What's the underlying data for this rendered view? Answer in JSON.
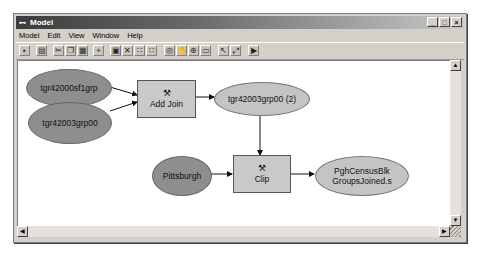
{
  "window": {
    "title": "Model",
    "app_icon": "model-builder-icon",
    "controls": {
      "minimize": "_",
      "maximize": "□",
      "close": "×"
    }
  },
  "menubar": {
    "items": [
      "Model",
      "Edit",
      "View",
      "Window",
      "Help"
    ]
  },
  "toolbar": {
    "buttons": [
      {
        "name": "save-icon",
        "glyph": "▪"
      },
      {
        "name": "print-icon",
        "glyph": "▤"
      },
      {
        "name": "cut-icon",
        "glyph": "✂"
      },
      {
        "name": "copy-icon",
        "glyph": "❐"
      },
      {
        "name": "paste-icon",
        "glyph": "▦"
      },
      {
        "name": "add-data-icon",
        "glyph": "+"
      },
      {
        "name": "properties-icon",
        "glyph": "▣"
      },
      {
        "name": "delete-icon",
        "glyph": "✕"
      },
      {
        "name": "layout-grid-icon",
        "glyph": "∷"
      },
      {
        "name": "layout-auto-icon",
        "glyph": "∷"
      },
      {
        "name": "zoom-full-icon",
        "glyph": "◎"
      },
      {
        "name": "pan-icon",
        "glyph": "✋"
      },
      {
        "name": "zoom-in-icon",
        "glyph": "⊕"
      },
      {
        "name": "zoom-extent-icon",
        "glyph": "▭"
      },
      {
        "name": "select-icon",
        "glyph": "↖"
      },
      {
        "name": "connect-icon",
        "glyph": "⤢"
      },
      {
        "name": "run-icon",
        "glyph": "▶"
      }
    ]
  },
  "diagram": {
    "nodes": [
      {
        "id": "n1",
        "label": "tgr42000sf1grp",
        "type": "input-data"
      },
      {
        "id": "n2",
        "label": "tgr42003grp00",
        "type": "input-data"
      },
      {
        "id": "n3",
        "label": "Add Join",
        "type": "tool"
      },
      {
        "id": "n4",
        "label": "tgr42003grp00 (2)",
        "type": "derived-data"
      },
      {
        "id": "n5",
        "label": "Pittsburgh",
        "type": "input-data"
      },
      {
        "id": "n6",
        "label": "Clip",
        "type": "tool"
      },
      {
        "id": "n7",
        "label": "PghCensusBlk GroupsJoined.s",
        "label_line1": "PghCensusBlk",
        "label_line2": "GroupsJoined.s",
        "type": "derived-data"
      }
    ],
    "edges": [
      [
        "n1",
        "n3"
      ],
      [
        "n2",
        "n3"
      ],
      [
        "n3",
        "n4"
      ],
      [
        "n4",
        "n6"
      ],
      [
        "n5",
        "n6"
      ],
      [
        "n6",
        "n7"
      ]
    ],
    "colors": {
      "input_data": "#8e8e8e",
      "derived_data": "#c4c4c4",
      "tool": "#c9c9c9"
    }
  },
  "scrollbars": {
    "up": "▲",
    "down": "▼",
    "left": "◀",
    "right": "▶"
  }
}
